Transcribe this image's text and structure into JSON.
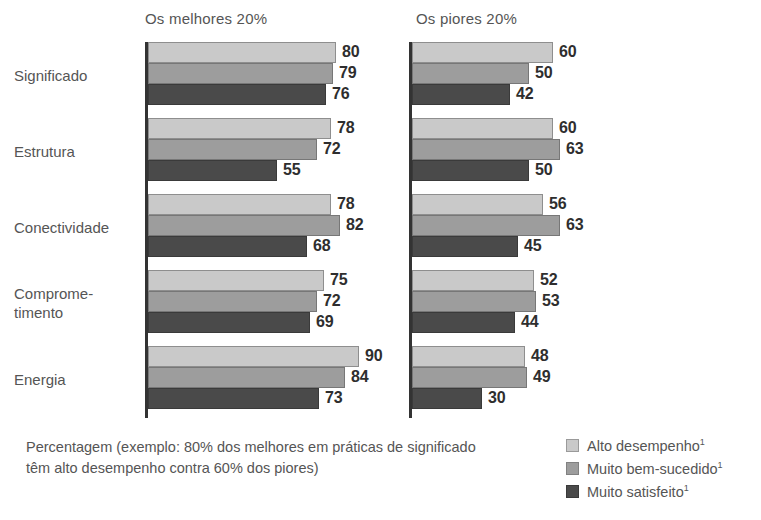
{
  "chart_data": {
    "type": "bar",
    "orientation": "horizontal",
    "title": "",
    "xlabel": "",
    "ylabel": "",
    "xlim": [
      0,
      100
    ],
    "grid": false,
    "legend_position": "bottom-right",
    "categories": [
      "Significado",
      "Estrutura",
      "Conectividade",
      "Comprome-timento",
      "Energia"
    ],
    "category_lines": [
      [
        "Significado"
      ],
      [
        "Estrutura"
      ],
      [
        "Conectividade"
      ],
      [
        "Comprome-",
        "timento"
      ],
      [
        "Energia"
      ]
    ],
    "series_names": [
      "Alto desempenho¹",
      "Muito bem-sucedido¹",
      "Muito satisfeito¹"
    ],
    "series_colors": [
      "#c9c9c9",
      "#9d9d9d",
      "#4a4a4a"
    ],
    "panels": [
      {
        "title": "Os melhores 20%",
        "series": [
          {
            "name": "Alto desempenho¹",
            "values": [
              80,
              78,
              78,
              75,
              90
            ]
          },
          {
            "name": "Muito bem-sucedido¹",
            "values": [
              79,
              72,
              82,
              72,
              84
            ]
          },
          {
            "name": "Muito satisfeito¹",
            "values": [
              76,
              55,
              68,
              69,
              73
            ]
          }
        ]
      },
      {
        "title": "Os piores 20%",
        "series": [
          {
            "name": "Alto desempenho¹",
            "values": [
              60,
              60,
              56,
              52,
              48
            ]
          },
          {
            "name": "Muito bem-sucedido¹",
            "values": [
              50,
              63,
              63,
              53,
              49
            ]
          },
          {
            "name": "Muito satisfeito¹",
            "values": [
              42,
              50,
              45,
              44,
              30
            ]
          }
        ]
      }
    ],
    "footnote": "Percentagem (exemplo: 80% dos melhores em práticas de significado têm alto desempenho contra 60% dos piores)"
  },
  "legend": {
    "items": [
      {
        "label": "Alto desempenho",
        "mark": "1"
      },
      {
        "label": "Muito bem-sucedido",
        "mark": "1"
      },
      {
        "label": "Muito satisfeito",
        "mark": "1"
      }
    ]
  },
  "colors": {
    "series_light": "#c9c9c9",
    "series_medium": "#9d9d9d",
    "series_dark": "#4a4a4a",
    "axis": "#333333",
    "text": "#555555",
    "value_text": "#2e2e2e",
    "background": "#ffffff"
  }
}
